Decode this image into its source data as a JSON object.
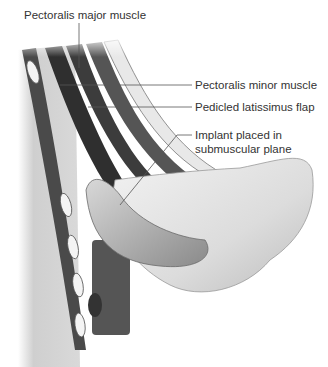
{
  "diagram": {
    "type": "anatomical-cross-section",
    "labels": [
      {
        "id": "pectoralis-major",
        "text": "Pectoralis major muscle"
      },
      {
        "id": "pectoralis-minor",
        "text": "Pectoralis minor muscle"
      },
      {
        "id": "latissimus-flap",
        "text": "Pedicled latissimus flap"
      },
      {
        "id": "implant-line1",
        "text": "Implant placed in"
      },
      {
        "id": "implant-line2",
        "text": "submuscular plane"
      }
    ],
    "colors": {
      "background": "#ffffff",
      "skin": "#e6e6e6",
      "muscle_dark": "#3a3a3a",
      "muscle_mid": "#6e6e6e",
      "implant": "#b8b8b8",
      "text": "#333333",
      "leader": "#555555"
    }
  }
}
